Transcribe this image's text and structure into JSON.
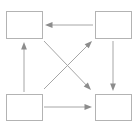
{
  "diagram": {
    "type": "flow-diagram",
    "canvas": {
      "width": 139,
      "height": 127,
      "background": "#ffffff"
    },
    "style": {
      "node_stroke_color": "#b3b3b3",
      "node_fill_color": "#ffffff",
      "node_stroke_width": 1,
      "edge_color": "#a6a6a6",
      "edge_width": 1,
      "arrowhead_color": "#8c8c8c"
    },
    "nodes": [
      {
        "id": "node-top-left",
        "label": "",
        "shape": "rectangle",
        "x": 6,
        "y": 11,
        "width": 36,
        "height": 27
      },
      {
        "id": "node-top-right",
        "label": "",
        "shape": "rectangle",
        "x": 95,
        "y": 11,
        "width": 36,
        "height": 27
      },
      {
        "id": "node-bottom-left",
        "label": "",
        "shape": "rectangle",
        "x": 6,
        "y": 94,
        "width": 36,
        "height": 26
      },
      {
        "id": "node-bottom-right",
        "label": "",
        "shape": "rectangle",
        "x": 95,
        "y": 94,
        "width": 36,
        "height": 26
      }
    ],
    "edges": [
      {
        "id": "edge-top-right-to-top-left",
        "label": "",
        "from": "node-top-right",
        "to": "node-top-left",
        "direction": "left",
        "x1": 93,
        "y1": 25,
        "x2": 45,
        "y2": 25
      },
      {
        "id": "edge-bottom-left-to-bottom-right",
        "label": "",
        "from": "node-bottom-left",
        "to": "node-bottom-right",
        "direction": "right",
        "x1": 44,
        "y1": 107,
        "x2": 92,
        "y2": 107
      },
      {
        "id": "edge-bottom-left-to-top-left",
        "label": "",
        "from": "node-bottom-left",
        "to": "node-top-left",
        "direction": "up",
        "x1": 24,
        "y1": 92,
        "x2": 24,
        "y2": 42
      },
      {
        "id": "edge-top-right-to-bottom-right",
        "label": "",
        "from": "node-top-right",
        "to": "node-bottom-right",
        "direction": "down",
        "x1": 113,
        "y1": 41,
        "x2": 113,
        "y2": 91
      },
      {
        "id": "edge-bottom-left-to-top-right",
        "label": "",
        "from": "node-bottom-left",
        "to": "node-top-right",
        "direction": "up-right",
        "x1": 44,
        "y1": 89,
        "x2": 92,
        "y2": 41
      },
      {
        "id": "edge-top-left-to-bottom-right",
        "label": "",
        "from": "node-top-left",
        "to": "node-bottom-right",
        "direction": "down-right",
        "x1": 44,
        "y1": 41,
        "x2": 91,
        "y2": 90
      }
    ]
  }
}
